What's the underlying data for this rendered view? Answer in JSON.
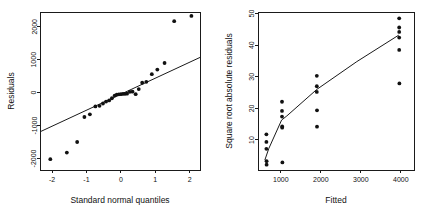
{
  "figure": {
    "width": 428,
    "height": 209,
    "background": "#ffffff",
    "ink_color": "#111111",
    "panel_count": 2
  },
  "chart_data": [
    {
      "id": "qq-plot",
      "type": "scatter",
      "title": "",
      "xlabel": "Standard normal quantiles",
      "ylabel": "Residuals",
      "xlim": [
        -2.35,
        2.3
      ],
      "ylim": [
        -2350,
        2450
      ],
      "xticks": [
        -2,
        -1,
        0,
        1,
        2
      ],
      "xticklabels": [
        "-2",
        "-1",
        "0",
        "1",
        "2"
      ],
      "yticks": [
        -2000,
        -1000,
        0,
        1000,
        2000
      ],
      "yticklabels": [
        "-2000",
        "-1000",
        "0",
        "1000",
        "2000"
      ],
      "grid": false,
      "legend": null,
      "point_marker": "filled-circle",
      "points": [
        {
          "x": -2.05,
          "y": -2020
        },
        {
          "x": -1.57,
          "y": -1820
        },
        {
          "x": -1.27,
          "y": -1500
        },
        {
          "x": -1.06,
          "y": -740
        },
        {
          "x": -0.9,
          "y": -660
        },
        {
          "x": -0.74,
          "y": -420
        },
        {
          "x": -0.62,
          "y": -400
        },
        {
          "x": -0.52,
          "y": -330
        },
        {
          "x": -0.43,
          "y": -270
        },
        {
          "x": -0.34,
          "y": -235
        },
        {
          "x": -0.26,
          "y": -170
        },
        {
          "x": -0.18,
          "y": -90
        },
        {
          "x": -0.12,
          "y": -60
        },
        {
          "x": -0.06,
          "y": -50
        },
        {
          "x": 0.0,
          "y": -45
        },
        {
          "x": 0.06,
          "y": -40
        },
        {
          "x": 0.12,
          "y": -35
        },
        {
          "x": 0.18,
          "y": -30
        },
        {
          "x": 0.26,
          "y": 25
        },
        {
          "x": 0.34,
          "y": 30
        },
        {
          "x": 0.43,
          "y": -45
        },
        {
          "x": 0.52,
          "y": 110
        },
        {
          "x": 0.62,
          "y": 300
        },
        {
          "x": 0.74,
          "y": 330
        },
        {
          "x": 0.9,
          "y": 560
        },
        {
          "x": 1.06,
          "y": 700
        },
        {
          "x": 1.27,
          "y": 900
        },
        {
          "x": 1.55,
          "y": 2170
        },
        {
          "x": 2.05,
          "y": 2330
        }
      ],
      "reference_line": {
        "kind": "straight",
        "from": {
          "x": -2.35,
          "y": -1190
        },
        "to": {
          "x": 2.3,
          "y": 1070
        }
      }
    },
    {
      "id": "scale-location-plot",
      "type": "scatter",
      "title": "",
      "xlabel": "Fitted",
      "ylabel": "Square root absolute residuals",
      "xlim": [
        430,
        4330
      ],
      "ylim": [
        0.5,
        50.5
      ],
      "xticks": [
        1000,
        2000,
        3000,
        4000
      ],
      "xticklabels": [
        "1000",
        "2000",
        "3000",
        "4000"
      ],
      "yticks": [
        10,
        20,
        30,
        40,
        50
      ],
      "yticklabels": [
        "10",
        "20",
        "30",
        "40",
        "50"
      ],
      "grid": false,
      "legend": null,
      "point_marker": "filled-circle",
      "points": [
        {
          "x": 640,
          "y": 11.8
        },
        {
          "x": 640,
          "y": 9.4
        },
        {
          "x": 640,
          "y": 7.2
        },
        {
          "x": 645,
          "y": 3.3
        },
        {
          "x": 645,
          "y": 2.2
        },
        {
          "x": 1030,
          "y": 22.1
        },
        {
          "x": 1030,
          "y": 19.2
        },
        {
          "x": 1030,
          "y": 17.4
        },
        {
          "x": 1035,
          "y": 14.3
        },
        {
          "x": 1035,
          "y": 13.9
        },
        {
          "x": 1040,
          "y": 2.9
        },
        {
          "x": 1900,
          "y": 30.3
        },
        {
          "x": 1900,
          "y": 27.0
        },
        {
          "x": 1900,
          "y": 25.2
        },
        {
          "x": 1905,
          "y": 19.4
        },
        {
          "x": 1905,
          "y": 14.2
        },
        {
          "x": 3960,
          "y": 48.5
        },
        {
          "x": 3960,
          "y": 45.6
        },
        {
          "x": 3960,
          "y": 44.2
        },
        {
          "x": 3960,
          "y": 42.4
        },
        {
          "x": 3960,
          "y": 38.5
        },
        {
          "x": 3965,
          "y": 27.9
        }
      ],
      "reference_line": {
        "kind": "polyline",
        "vertices": [
          {
            "x": 600,
            "y": 3.6
          },
          {
            "x": 700,
            "y": 7.3
          },
          {
            "x": 1020,
            "y": 16.3
          },
          {
            "x": 1150,
            "y": 17.6
          },
          {
            "x": 1900,
            "y": 26.0
          },
          {
            "x": 2900,
            "y": 34.8
          },
          {
            "x": 3950,
            "y": 43.2
          }
        ]
      }
    }
  ]
}
